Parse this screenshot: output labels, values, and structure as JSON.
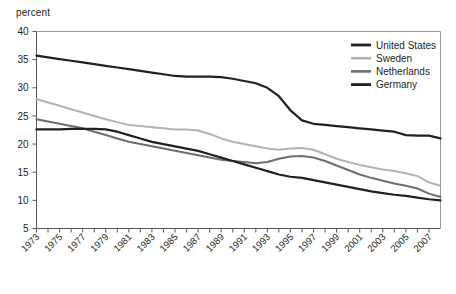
{
  "chart_data": {
    "type": "line",
    "title": "",
    "subtitle": "",
    "xlabel": "",
    "ylabel": "percent",
    "ylim": [
      5,
      40
    ],
    "xlim": [
      1973,
      2008
    ],
    "yticks": [
      5,
      10,
      15,
      20,
      25,
      30,
      35,
      40
    ],
    "xticks": [
      1973,
      1975,
      1977,
      1979,
      1981,
      1983,
      1985,
      1987,
      1989,
      1991,
      1993,
      1995,
      1997,
      1999,
      2001,
      2003,
      2005,
      2007
    ],
    "xticks_minor_step": 1,
    "grid": false,
    "legend_position": "top-right",
    "x": [
      1973,
      1974,
      1975,
      1976,
      1977,
      1978,
      1979,
      1980,
      1981,
      1982,
      1983,
      1984,
      1985,
      1986,
      1987,
      1988,
      1989,
      1990,
      1991,
      1992,
      1993,
      1994,
      1995,
      1996,
      1997,
      1998,
      1999,
      2000,
      2001,
      2002,
      2003,
      2004,
      2005,
      2006,
      2007,
      2008
    ],
    "series": [
      {
        "name": "United States",
        "color": "#231f20",
        "width": 2.2,
        "values": [
          35.7,
          35.4,
          35.1,
          34.8,
          34.5,
          34.2,
          33.9,
          33.6,
          33.3,
          33.0,
          32.7,
          32.4,
          32.1,
          32.0,
          32.0,
          32.0,
          31.9,
          31.6,
          31.2,
          30.8,
          30.0,
          28.5,
          26.0,
          24.2,
          23.6,
          23.4,
          23.2,
          23.0,
          22.8,
          22.6,
          22.4,
          22.2,
          21.6,
          21.5,
          21.5,
          21.0
        ]
      },
      {
        "name": "Sweden",
        "color": "#b2b2b2",
        "width": 2.0,
        "values": [
          28.0,
          27.4,
          26.8,
          26.2,
          25.6,
          25.0,
          24.4,
          23.9,
          23.4,
          23.2,
          23.0,
          22.8,
          22.6,
          22.6,
          22.4,
          21.8,
          21.0,
          20.4,
          20.0,
          19.6,
          19.2,
          19.0,
          19.2,
          19.3,
          19.0,
          18.2,
          17.4,
          16.8,
          16.3,
          15.9,
          15.5,
          15.2,
          14.8,
          14.3,
          13.2,
          12.6
        ]
      },
      {
        "name": "Netherlands",
        "color": "#6d6e71",
        "width": 2.0,
        "values": [
          24.4,
          24.0,
          23.6,
          23.2,
          22.8,
          22.2,
          21.6,
          21.0,
          20.4,
          20.0,
          19.6,
          19.2,
          18.8,
          18.4,
          18.0,
          17.6,
          17.2,
          17.0,
          16.8,
          16.6,
          16.8,
          17.4,
          17.8,
          17.9,
          17.6,
          17.0,
          16.2,
          15.4,
          14.6,
          14.0,
          13.5,
          13.0,
          12.6,
          12.1,
          11.2,
          10.6
        ]
      },
      {
        "name": "Germany",
        "color": "#231f20",
        "width": 2.2,
        "values": [
          22.6,
          22.6,
          22.6,
          22.7,
          22.7,
          22.7,
          22.6,
          22.2,
          21.6,
          21.0,
          20.4,
          20.0,
          19.6,
          19.2,
          18.8,
          18.2,
          17.6,
          17.0,
          16.4,
          15.8,
          15.2,
          14.6,
          14.2,
          14.0,
          13.6,
          13.2,
          12.8,
          12.4,
          12.0,
          11.6,
          11.3,
          11.0,
          10.8,
          10.5,
          10.2,
          10.0
        ]
      }
    ]
  },
  "legend": {
    "items": [
      {
        "label": "United States"
      },
      {
        "label": "Sweden"
      },
      {
        "label": "Netherlands"
      },
      {
        "label": "Germany"
      }
    ]
  }
}
